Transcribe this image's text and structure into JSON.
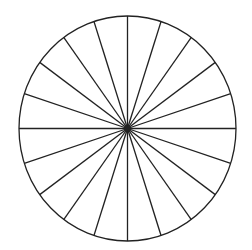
{
  "diagram": {
    "type": "circle-divided-into-equal-sectors",
    "sectors": 20,
    "sector_angle_deg": 18,
    "center": {
      "x": 127.5,
      "y": 128.5
    },
    "radius_x": 108.5,
    "radius_y": 112.5,
    "start_angle_deg": 90,
    "stroke_color": "#222222",
    "stroke_width": 1.3,
    "fill_color": "#ffffff",
    "center_dot_radius": 3
  }
}
